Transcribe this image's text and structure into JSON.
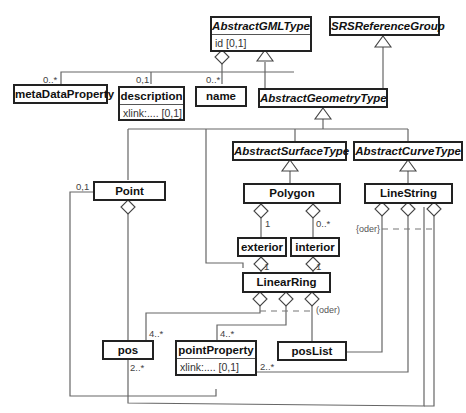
{
  "diagram": {
    "type": "UML class diagram",
    "classes": {
      "abstract_gml_type": {
        "name": "AbstractGMLType",
        "abstract": true,
        "attribute": "id [0,1]"
      },
      "srs_reference_group": {
        "name": "SRSReferenceGroup",
        "abstract": true
      },
      "meta_data_property": {
        "name": "metaDataProperty"
      },
      "description": {
        "name": "description",
        "attribute": "xlink:....  [0,1]"
      },
      "name": {
        "name": "name"
      },
      "abstract_geometry_type": {
        "name": "AbstractGeometryType",
        "abstract": true
      },
      "abstract_surface_type": {
        "name": "AbstractSurfaceType",
        "abstract": true
      },
      "abstract_curve_type": {
        "name": "AbstractCurveType",
        "abstract": true
      },
      "point": {
        "name": "Point"
      },
      "polygon": {
        "name": "Polygon"
      },
      "line_string": {
        "name": "LineString"
      },
      "exterior": {
        "name": "exterior"
      },
      "interior": {
        "name": "interior"
      },
      "linear_ring": {
        "name": "LinearRing"
      },
      "pos": {
        "name": "pos"
      },
      "point_property": {
        "name": "pointProperty",
        "attribute": "xlink:....  [0,1]"
      },
      "pos_list": {
        "name": "posList"
      }
    },
    "multiplicities": {
      "meta_data_property": "0..*",
      "description": "0,1",
      "name": "0..*",
      "point_to_pos": "0,1",
      "polygon_exterior": "1",
      "polygon_interior": "0..*",
      "exterior_ring": "1",
      "interior_ring": "1",
      "ring_pos": "4..*",
      "ring_point_property": "4..*",
      "linestring_pos": "2..*",
      "linestring_point_property": "2..*"
    },
    "notes": {
      "linestring_constraint": "{oder}",
      "linearring_constraint": "(oder)"
    }
  }
}
